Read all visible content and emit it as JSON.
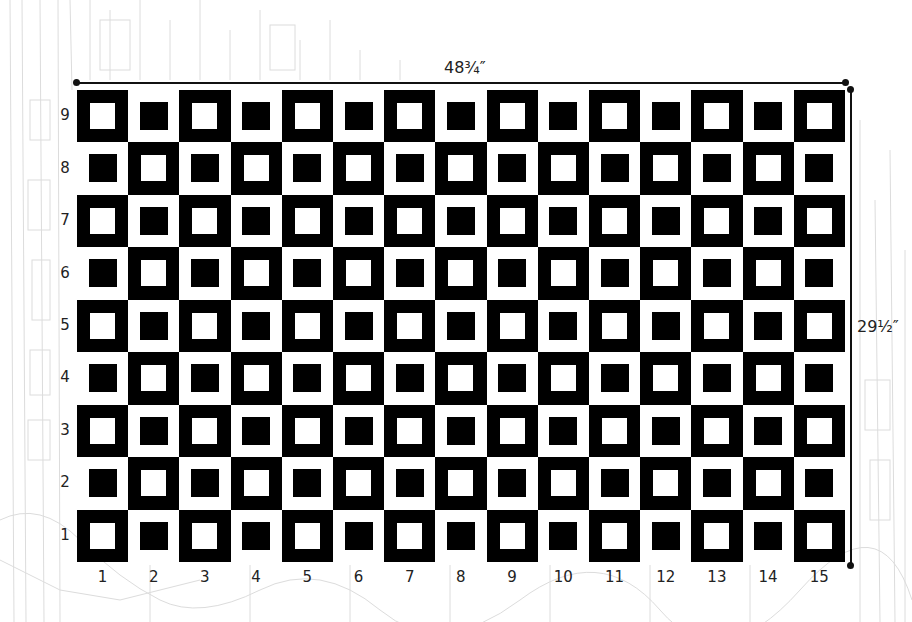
{
  "diagram": {
    "type": "quilt-layout-grid",
    "width_label": "48¾″",
    "height_label": "29½″",
    "columns": 15,
    "rows": 9,
    "column_labels": [
      "1",
      "2",
      "3",
      "4",
      "5",
      "6",
      "7",
      "8",
      "9",
      "10",
      "11",
      "12",
      "13",
      "14",
      "15"
    ],
    "row_labels_top_to_bottom": [
      "9",
      "8",
      "7",
      "6",
      "5",
      "4",
      "3",
      "2",
      "1"
    ],
    "block_types": {
      "A": "black frame with white center square",
      "B": "white frame with black center square"
    },
    "pattern_rule": "Block A where (column + row) is even, Block B otherwise; alternating checkerboard",
    "colors": {
      "dark": "#000000",
      "light": "#ffffff",
      "background_sketch": "#d8d8d8"
    }
  }
}
